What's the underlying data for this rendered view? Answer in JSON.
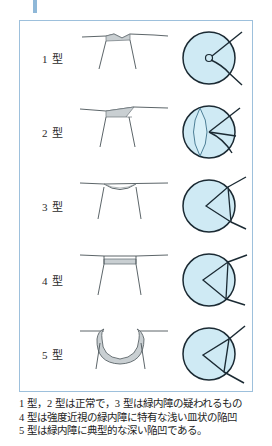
{
  "figure": {
    "marker_color": "#8fb8d8",
    "border_color": "#9dc0dc",
    "disc_fill_color": "#cfeaf4",
    "disc_stroke_color": "#1b2a33",
    "profile_fill_color": "#c9cfd2",
    "profile_stroke_color": "#4a5358",
    "rows": [
      {
        "label": "1 型",
        "profile_name": "flat-profile-type-1",
        "disc_name": "optic-disc-type-1",
        "description": "ほぼ平坦、わずかな切れ込み"
      },
      {
        "label": "2 型",
        "profile_name": "sloped-profile-type-2",
        "disc_name": "optic-disc-type-2",
        "description": "斜めに傾斜した浅い陥凹"
      },
      {
        "label": "3 型",
        "profile_name": "saucer-profile-type-3",
        "disc_name": "optic-disc-type-3",
        "description": "浅い皿状の陥凹"
      },
      {
        "label": "4 型",
        "profile_name": "flat-bottom-profile-type-4",
        "disc_name": "optic-disc-type-4",
        "description": "平底の浅い陥凹"
      },
      {
        "label": "5 型",
        "profile_name": "deep-cup-profile-type-5",
        "disc_name": "optic-disc-type-5",
        "description": "深い陥凹"
      }
    ]
  },
  "caption": {
    "line1": "1 型，2 型は正常で，3 型は緑内障の疑われるもの",
    "line2": "4 型は強度近視の緑内障に特有な浅い皿状の陥凹",
    "line3": "5 型は緑内障に典型的な深い陥凹である。"
  }
}
